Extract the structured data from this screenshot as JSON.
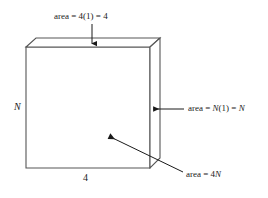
{
  "figure": {
    "kind": "geometry-diagram",
    "stroke_color": "#4d4d4d",
    "face_fill": "#ffffff",
    "background": "#ffffff"
  },
  "labels": {
    "top_face": {
      "full_text": "area = 4(1) = 4",
      "prefix": "area = 4(1) = 4",
      "target": "top-face"
    },
    "right_face": {
      "prefix": "area = ",
      "variable_1": "N",
      "middle": "(1) = ",
      "variable_2": "N",
      "full_text": "area = N(1) = N",
      "target": "right-face"
    },
    "front_face": {
      "prefix": "area = 4",
      "variable_1": "N",
      "full_text": "area = 4N",
      "target": "front-face"
    },
    "height_dimension": {
      "text": "N",
      "target": "left-edge"
    },
    "width_dimension": {
      "text": "4",
      "target": "bottom-edge"
    }
  },
  "geometry": {
    "front_face": {
      "top_left": [
        26,
        47
      ],
      "top_right": [
        150,
        47
      ],
      "bottom_right": [
        150,
        168
      ],
      "bottom_left": [
        26,
        168
      ]
    },
    "back_top_left": [
      36,
      38
    ],
    "back_top_right": [
      160,
      38
    ],
    "back_bottom_right": [
      160,
      158
    ],
    "arrows": {
      "top_arrow": {
        "from": [
          92,
          24
        ],
        "to": [
          92,
          44
        ]
      },
      "right_arrow": {
        "from": [
          184,
          109
        ],
        "to": [
          152,
          109
        ]
      },
      "front_arrow": {
        "from": [
          183,
          172
        ],
        "to": [
          108,
          136
        ]
      }
    }
  }
}
